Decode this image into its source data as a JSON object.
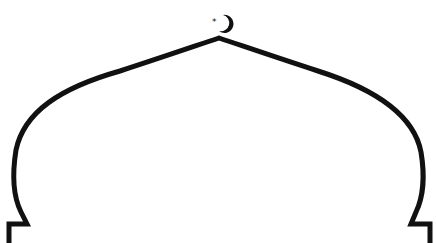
{
  "figure": {
    "stroke_color": "#111111",
    "background_color": "#ffffff",
    "ornament": "crescent-and-star"
  }
}
